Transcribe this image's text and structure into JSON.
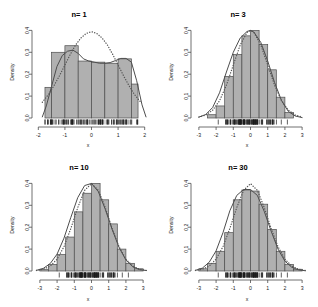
{
  "figure": {
    "layout": "2x2 grid of histograms",
    "background": "#ffffff",
    "bar_fill": "#b0b0b0",
    "bar_stroke": "#4d4d4d",
    "density_curve_color": "#4d4d4d",
    "normal_curve_color": "#555555",
    "normal_curve_style": "dotted",
    "axis_color": "#4d4d4d"
  },
  "panels": [
    {
      "id": "panel-n1",
      "title": "n= 1",
      "xlabel": "x",
      "ylabel": "Density",
      "xticks": [
        "-2",
        "-1",
        "0",
        "1",
        "2"
      ],
      "xtick_values": [
        -2,
        -1,
        0,
        1,
        2
      ],
      "yticks": [
        "0.0",
        "0.1",
        "0.2",
        "0.3",
        "0.4"
      ],
      "ytick_values": [
        0.0,
        0.1,
        0.2,
        0.3,
        0.4
      ]
    },
    {
      "id": "panel-n3",
      "title": "n= 3",
      "xlabel": "x",
      "ylabel": "Density",
      "xticks": [
        "-3",
        "-2",
        "-1",
        "0",
        "1",
        "2",
        "3"
      ],
      "xtick_values": [
        -3,
        -2,
        -1,
        0,
        1,
        2,
        3
      ],
      "yticks": [
        "0.0",
        "0.1",
        "0.2",
        "0.3",
        "0.4"
      ],
      "ytick_values": [
        0.0,
        0.1,
        0.2,
        0.3,
        0.4
      ]
    },
    {
      "id": "panel-n10",
      "title": "n= 10",
      "xlabel": "x",
      "ylabel": "Density",
      "xticks": [
        "-3",
        "-2",
        "-1",
        "0",
        "1",
        "2",
        "3"
      ],
      "xtick_values": [
        -3,
        -2,
        -1,
        0,
        1,
        2,
        3
      ],
      "yticks": [
        "0.0",
        "0.1",
        "0.2",
        "0.3",
        "0.4"
      ],
      "ytick_values": [
        0.0,
        0.1,
        0.2,
        0.3,
        0.4
      ]
    },
    {
      "id": "panel-n30",
      "title": "n= 30",
      "xlabel": "x",
      "ylabel": "Density",
      "xticks": [
        "-3",
        "-2",
        "-1",
        "0",
        "1",
        "2",
        "3"
      ],
      "xtick_values": [
        -3,
        -2,
        -1,
        0,
        1,
        2,
        3
      ],
      "yticks": [
        "0.0",
        "0.1",
        "0.2",
        "0.3",
        "0.4"
      ],
      "ytick_values": [
        0.0,
        0.1,
        0.2,
        0.3,
        0.4
      ]
    }
  ],
  "chart_data": [
    {
      "type": "bar",
      "id": "panel-n1",
      "title": "n= 1",
      "xlabel": "x",
      "ylabel": "Density",
      "xlim": [
        -2.2,
        2.2
      ],
      "ylim": [
        0,
        0.42
      ],
      "grid": false,
      "legend": "none",
      "bin_edges": [
        -1.75,
        -1.5,
        -1.0,
        -0.5,
        0.0,
        0.5,
        1.0,
        1.5,
        1.75
      ],
      "bin_width": 0.5,
      "values": [
        0.14,
        0.3,
        0.33,
        0.26,
        0.255,
        0.25,
        0.27,
        0.155
      ],
      "series": [
        {
          "name": "density estimate",
          "style": "solid",
          "x": [
            -1.85,
            -1.7,
            -1.5,
            -1.3,
            -1.1,
            -0.9,
            -0.7,
            -0.5,
            -0.3,
            -0.1,
            0.1,
            0.3,
            0.5,
            0.7,
            0.9,
            1.1,
            1.3,
            1.5,
            1.7,
            1.9,
            2.05
          ],
          "y": [
            0.005,
            0.055,
            0.145,
            0.235,
            0.285,
            0.305,
            0.31,
            0.295,
            0.27,
            0.26,
            0.255,
            0.25,
            0.25,
            0.253,
            0.262,
            0.272,
            0.272,
            0.255,
            0.17,
            0.06,
            0.005
          ]
        },
        {
          "name": "normal curve",
          "style": "dotted",
          "x": [
            -1.85,
            -1.6,
            -1.4,
            -1.2,
            -1.0,
            -0.8,
            -0.6,
            -0.4,
            -0.2,
            0.0,
            0.2,
            0.4,
            0.6,
            0.8,
            1.0,
            1.2,
            1.4,
            1.6,
            1.85
          ],
          "y": [
            0.072,
            0.11,
            0.15,
            0.194,
            0.242,
            0.29,
            0.333,
            0.365,
            0.386,
            0.394,
            0.386,
            0.365,
            0.333,
            0.29,
            0.242,
            0.194,
            0.15,
            0.11,
            0.072
          ]
        }
      ],
      "rug": true
    },
    {
      "type": "bar",
      "id": "panel-n3",
      "title": "n= 3",
      "xlabel": "x",
      "ylabel": "Density",
      "xlim": [
        -3.4,
        3.4
      ],
      "ylim": [
        0,
        0.42
      ],
      "grid": false,
      "legend": "none",
      "bin_edges": [
        -2.5,
        -2.0,
        -1.5,
        -1.0,
        -0.5,
        0.0,
        0.5,
        1.0,
        1.5,
        2.0,
        2.5
      ],
      "bin_width": 0.5,
      "values": [
        0.015,
        0.055,
        0.19,
        0.29,
        0.375,
        0.4,
        0.335,
        0.22,
        0.095,
        0.025
      ],
      "series": [
        {
          "name": "density estimate",
          "style": "solid",
          "x": [
            -3.0,
            -2.6,
            -2.2,
            -1.8,
            -1.4,
            -1.0,
            -0.6,
            -0.2,
            0.0,
            0.2,
            0.6,
            1.0,
            1.4,
            1.8,
            2.2,
            2.6,
            3.0
          ],
          "y": [
            0.004,
            0.016,
            0.048,
            0.115,
            0.21,
            0.3,
            0.365,
            0.395,
            0.4,
            0.392,
            0.345,
            0.26,
            0.162,
            0.08,
            0.03,
            0.009,
            0.002
          ]
        },
        {
          "name": "normal curve",
          "style": "dotted",
          "x": [
            -3.0,
            -2.6,
            -2.2,
            -1.8,
            -1.4,
            -1.0,
            -0.6,
            -0.2,
            0.0,
            0.2,
            0.6,
            1.0,
            1.4,
            1.8,
            2.2,
            2.6,
            3.0
          ],
          "y": [
            0.0044,
            0.0136,
            0.0355,
            0.079,
            0.1497,
            0.242,
            0.3332,
            0.391,
            0.3989,
            0.391,
            0.3332,
            0.242,
            0.1497,
            0.079,
            0.0355,
            0.0136,
            0.0044
          ]
        }
      ],
      "rug": true
    },
    {
      "type": "bar",
      "id": "panel-n10",
      "title": "n= 10",
      "xlabel": "x",
      "ylabel": "Density",
      "xlim": [
        -3.4,
        3.4
      ],
      "ylim": [
        0,
        0.42
      ],
      "grid": false,
      "legend": "none",
      "bin_edges": [
        -3.0,
        -2.5,
        -2.0,
        -1.5,
        -1.0,
        -0.5,
        0.0,
        0.5,
        1.0,
        1.5,
        2.0,
        2.5,
        3.0
      ],
      "bin_width": 0.5,
      "values": [
        0.008,
        0.03,
        0.075,
        0.155,
        0.27,
        0.355,
        0.4,
        0.325,
        0.215,
        0.1,
        0.035,
        0.01
      ],
      "series": [
        {
          "name": "density estimate",
          "style": "solid",
          "x": [
            -3.2,
            -2.8,
            -2.4,
            -2.0,
            -1.6,
            -1.2,
            -0.8,
            -0.4,
            0.0,
            0.4,
            0.8,
            1.2,
            1.6,
            2.0,
            2.4,
            2.8,
            3.2
          ],
          "y": [
            0.003,
            0.012,
            0.034,
            0.077,
            0.15,
            0.245,
            0.335,
            0.39,
            0.4,
            0.362,
            0.282,
            0.19,
            0.108,
            0.05,
            0.019,
            0.006,
            0.002
          ]
        },
        {
          "name": "normal curve",
          "style": "dotted",
          "x": [
            -3.2,
            -2.8,
            -2.4,
            -2.0,
            -1.6,
            -1.2,
            -0.8,
            -0.4,
            0.0,
            0.4,
            0.8,
            1.2,
            1.6,
            2.0,
            2.4,
            2.8,
            3.2
          ],
          "y": [
            0.0024,
            0.0079,
            0.0224,
            0.054,
            0.1109,
            0.1942,
            0.2897,
            0.3683,
            0.3989,
            0.3683,
            0.2897,
            0.1942,
            0.1109,
            0.054,
            0.0224,
            0.0079,
            0.0024
          ]
        }
      ],
      "rug": true
    },
    {
      "type": "bar",
      "id": "panel-n30",
      "title": "n= 30",
      "xlabel": "x",
      "ylabel": "Density",
      "xlim": [
        -3.4,
        3.4
      ],
      "ylim": [
        0,
        0.42
      ],
      "grid": false,
      "legend": "none",
      "bin_edges": [
        -3.0,
        -2.5,
        -2.0,
        -1.5,
        -1.0,
        -0.5,
        0.0,
        0.5,
        1.0,
        1.5,
        2.0,
        2.5,
        3.0
      ],
      "bin_width": 0.5,
      "values": [
        0.01,
        0.035,
        0.09,
        0.175,
        0.325,
        0.37,
        0.365,
        0.305,
        0.19,
        0.09,
        0.03,
        0.008
      ],
      "series": [
        {
          "name": "density estimate",
          "style": "solid",
          "x": [
            -3.2,
            -2.8,
            -2.4,
            -2.0,
            -1.6,
            -1.2,
            -0.8,
            -0.4,
            0.0,
            0.4,
            0.8,
            1.2,
            1.6,
            2.0,
            2.4,
            2.8,
            3.2
          ],
          "y": [
            0.003,
            0.013,
            0.04,
            0.092,
            0.175,
            0.275,
            0.345,
            0.372,
            0.372,
            0.345,
            0.272,
            0.182,
            0.1,
            0.045,
            0.017,
            0.005,
            0.001
          ]
        },
        {
          "name": "normal curve",
          "style": "dotted",
          "x": [
            -3.2,
            -2.8,
            -2.4,
            -2.0,
            -1.6,
            -1.2,
            -0.8,
            -0.4,
            0.0,
            0.4,
            0.8,
            1.2,
            1.6,
            2.0,
            2.4,
            2.8,
            3.2
          ],
          "y": [
            0.0024,
            0.0079,
            0.0224,
            0.054,
            0.1109,
            0.1942,
            0.2897,
            0.3683,
            0.3989,
            0.3683,
            0.2897,
            0.1942,
            0.1109,
            0.054,
            0.0224,
            0.0079,
            0.0024
          ]
        }
      ],
      "rug": true
    }
  ]
}
